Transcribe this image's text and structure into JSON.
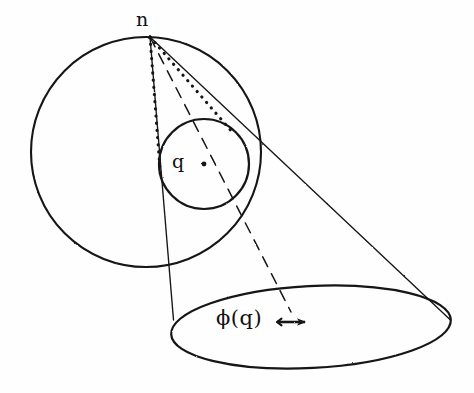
{
  "figure": {
    "background_color": "#fefefe",
    "ink_color": "#141414",
    "labels": {
      "apex": "n",
      "small_disk": "q",
      "projected_disk": "ϕ(q)"
    },
    "elements": [
      {
        "name": "big-sphere-circle",
        "kind": "circle",
        "cx": 146,
        "cy": 152,
        "r": 115,
        "stroke": "#141414",
        "style": "solid"
      },
      {
        "name": "small-disk-circle",
        "kind": "circle",
        "cx": 204,
        "cy": 164,
        "r": 45,
        "stroke": "#141414",
        "style": "solid"
      },
      {
        "name": "projection-plane-ellipse",
        "kind": "ellipse",
        "cx": 311,
        "cy": 327,
        "rx": 140,
        "ry": 41,
        "rotation": -3,
        "stroke": "#141414",
        "style": "solid"
      },
      {
        "name": "apex-point",
        "kind": "point",
        "x": 150,
        "y": 37
      },
      {
        "name": "small-disk-center-point",
        "kind": "point",
        "x": 204,
        "y": 164
      },
      {
        "name": "cone-line-left",
        "kind": "line",
        "x1": 150,
        "y1": 37,
        "x2": 174,
        "y2": 320,
        "style": "solid"
      },
      {
        "name": "cone-line-right",
        "kind": "line",
        "x1": 150,
        "y1": 37,
        "x2": 450,
        "y2": 320,
        "style": "solid"
      },
      {
        "name": "tangent-dotted-left",
        "kind": "line",
        "x1": 150,
        "y1": 37,
        "x2": 160,
        "y2": 176,
        "style": "dotted"
      },
      {
        "name": "tangent-dotted-right",
        "kind": "line",
        "x1": 150,
        "y1": 37,
        "x2": 232,
        "y2": 132,
        "style": "dotted"
      },
      {
        "name": "axis-dashed-line",
        "kind": "line",
        "x1": 150,
        "y1": 37,
        "x2": 290,
        "y2": 310,
        "style": "dashed"
      },
      {
        "name": "direction-arrow",
        "kind": "arrow",
        "x1": 276,
        "y1": 322,
        "x2": 312,
        "y2": 322,
        "direction": "right"
      }
    ]
  }
}
